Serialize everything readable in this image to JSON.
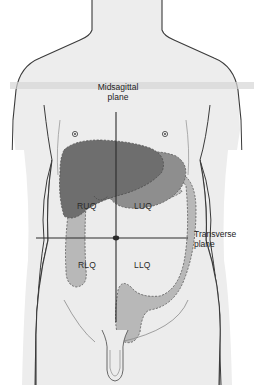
{
  "diagram": {
    "planes": {
      "midsagittal": {
        "line1": "Midsagittal",
        "line2": "plane"
      },
      "transverse": {
        "line1": "Transverse",
        "line2": "plane"
      }
    },
    "quadrants": {
      "ruq": "RUQ",
      "luq": "LUQ",
      "rlq": "RLQ",
      "llq": "LLQ"
    },
    "colors": {
      "skin": "#ededed",
      "outline": "#3a3a3a",
      "liver": "#6e6e6e",
      "stomach": "#8e8e8e",
      "intestine": "#b8b8b8",
      "plane_line": "#2b2b2b",
      "band": "#d6d6d6"
    }
  }
}
